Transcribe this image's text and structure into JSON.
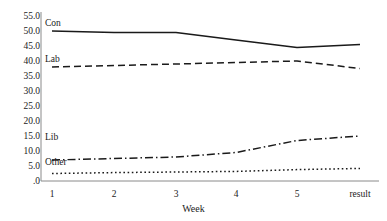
{
  "chart_data": {
    "type": "line",
    "title": "",
    "xlabel": "Week",
    "ylabel": "",
    "categories": [
      "1",
      "2",
      "3",
      "4",
      "5",
      "result"
    ],
    "ylim": [
      0,
      55
    ],
    "ytick_labels": [
      "55.0",
      "50.0",
      "45.0",
      "40.0",
      "35.0",
      "30.0",
      "25.0",
      "20.0",
      "15.0",
      "10.0",
      "5.0",
      ".0"
    ],
    "ytick_values": [
      55,
      50,
      45,
      40,
      35,
      30,
      25,
      20,
      15,
      10,
      5,
      0
    ],
    "grid": false,
    "legend_position": "inline-left-of-line",
    "series": [
      {
        "name": "Con",
        "values": [
          50.0,
          49.5,
          49.5,
          47.0,
          44.5,
          45.5
        ],
        "style": "solid",
        "color": "#1a1a1a"
      },
      {
        "name": "Lab",
        "values": [
          38.0,
          38.5,
          39.0,
          39.5,
          40.0,
          37.5
        ],
        "style": "dashed",
        "color": "#1a1a1a"
      },
      {
        "name": "Lib",
        "values": [
          7.0,
          7.5,
          8.0,
          9.5,
          13.5,
          15.0
        ],
        "style": "dashdot",
        "color": "#1a1a1a"
      },
      {
        "name": "Other",
        "values": [
          2.5,
          2.8,
          3.0,
          3.2,
          3.8,
          4.2
        ],
        "style": "dotted",
        "color": "#1a1a1a"
      }
    ],
    "series_label_positions": [
      {
        "name": "Con",
        "x": 45,
        "y": 18
      },
      {
        "name": "Lab",
        "x": 45,
        "y": 54
      },
      {
        "name": "Lib",
        "x": 45,
        "y": 132
      },
      {
        "name": "Other",
        "x": 45,
        "y": 157
      }
    ]
  },
  "axis": {
    "axis_color": "#8a8a8a"
  }
}
